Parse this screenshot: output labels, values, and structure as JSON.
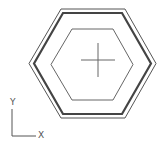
{
  "drawing": {
    "type": "cad-drawing",
    "background": "#ffffff",
    "shapes": [
      {
        "name": "outer-hexagon",
        "points": "29,63.5 61,9 125,9 156,63.5 125,118 61,118",
        "stroke": "#555555",
        "stroke_width": 1
      },
      {
        "name": "thick-hexagon",
        "points": "34,63.5 63,13 122,13 151,63.5 122,114 63,114",
        "stroke": "#444444",
        "stroke_width": 2.2
      },
      {
        "name": "inner-hexagon",
        "points": "51,64.5 72,29 113,29 133,64.5 113,100 72,100",
        "stroke": "#666666",
        "stroke_width": 1
      }
    ],
    "crosshair": {
      "cx": 98,
      "cy": 60,
      "half_w": 17,
      "half_h": 17,
      "stroke": "#666666"
    }
  },
  "ucs_icon": {
    "y_label": "Y",
    "x_label": "X",
    "color": "#555555"
  }
}
